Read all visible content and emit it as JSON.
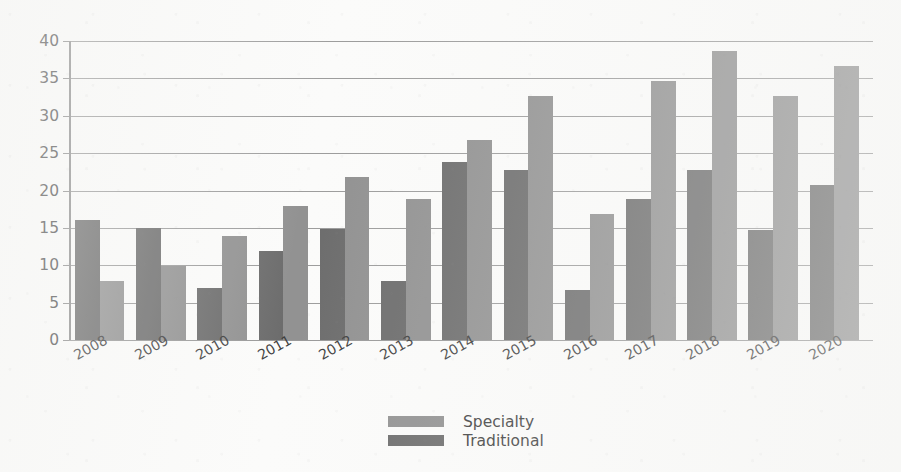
{
  "chart_data": {
    "type": "bar",
    "title": "",
    "xlabel": "",
    "ylabel": "",
    "categories": [
      "2008",
      "2009",
      "2010",
      "2011",
      "2012",
      "2013",
      "2014",
      "2015",
      "2016",
      "2017",
      "2018",
      "2019",
      "2020"
    ],
    "series": [
      {
        "name": "Traditional",
        "color": "#6d6d6d",
        "values": [
          16.0,
          15.0,
          7.0,
          11.9,
          14.8,
          7.9,
          23.8,
          22.7,
          6.7,
          18.8,
          22.7,
          14.7,
          20.7
        ]
      },
      {
        "name": "Specialty",
        "color": "#929292",
        "values": [
          7.9,
          9.9,
          13.9,
          17.9,
          21.8,
          18.9,
          26.8,
          32.7,
          16.8,
          34.7,
          38.7,
          32.6,
          36.6
        ]
      }
    ],
    "ylim": [
      0,
      40
    ],
    "yticks": [
      0,
      5,
      10,
      15,
      20,
      25,
      30,
      35,
      40
    ],
    "ytick_labels": [
      "0",
      "5",
      "10",
      "15",
      "20",
      "25",
      "30",
      "35",
      "40"
    ],
    "grid": true,
    "legend_position": "bottom-center",
    "legend": [
      {
        "label": "Specialty",
        "color": "#929292"
      },
      {
        "label": "Traditional",
        "color": "#6d6d6d"
      }
    ]
  }
}
